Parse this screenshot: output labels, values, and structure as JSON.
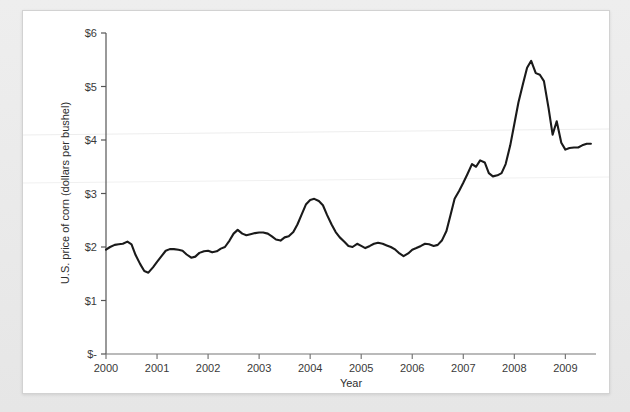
{
  "chart_data": {
    "type": "line",
    "title": "",
    "xlabel": "Year",
    "ylabel": "U.S. price of corn (dollars per bushel)",
    "xlim": [
      2000,
      2009.6
    ],
    "ylim": [
      0,
      6
    ],
    "grid": false,
    "legend": null,
    "line_color": "#1a1a1a",
    "x_tick_labels": [
      "2000",
      "2001",
      "2002",
      "2003",
      "2004",
      "2005",
      "2006",
      "2007",
      "2008",
      "2009"
    ],
    "x_ticks": [
      2000,
      2001,
      2002,
      2003,
      2004,
      2005,
      2006,
      2007,
      2008,
      2009
    ],
    "y_tick_labels": [
      "$-",
      "$1",
      "$2",
      "$3",
      "$4",
      "$5",
      "$6"
    ],
    "y_ticks": [
      0,
      1,
      2,
      3,
      4,
      5,
      6
    ],
    "series": [
      {
        "name": "U.S. price of corn",
        "x": [
          2000.0,
          2000.08,
          2000.17,
          2000.25,
          2000.33,
          2000.42,
          2000.5,
          2000.58,
          2000.67,
          2000.75,
          2000.83,
          2000.92,
          2001.0,
          2001.08,
          2001.17,
          2001.25,
          2001.33,
          2001.42,
          2001.5,
          2001.58,
          2001.67,
          2001.75,
          2001.83,
          2001.92,
          2002.0,
          2002.08,
          2002.17,
          2002.25,
          2002.33,
          2002.42,
          2002.5,
          2002.58,
          2002.67,
          2002.75,
          2002.83,
          2002.92,
          2003.0,
          2003.08,
          2003.17,
          2003.25,
          2003.33,
          2003.42,
          2003.5,
          2003.58,
          2003.67,
          2003.75,
          2003.83,
          2003.92,
          2004.0,
          2004.08,
          2004.17,
          2004.25,
          2004.33,
          2004.42,
          2004.5,
          2004.58,
          2004.67,
          2004.75,
          2004.83,
          2004.92,
          2005.0,
          2005.08,
          2005.17,
          2005.25,
          2005.33,
          2005.42,
          2005.5,
          2005.58,
          2005.67,
          2005.75,
          2005.83,
          2005.92,
          2006.0,
          2006.08,
          2006.17,
          2006.25,
          2006.33,
          2006.42,
          2006.5,
          2006.58,
          2006.67,
          2006.75,
          2006.83,
          2006.92,
          2007.0,
          2007.08,
          2007.17,
          2007.25,
          2007.33,
          2007.42,
          2007.5,
          2007.58,
          2007.67,
          2007.75,
          2007.83,
          2007.92,
          2008.0,
          2008.08,
          2008.17,
          2008.25,
          2008.33,
          2008.42,
          2008.5,
          2008.58,
          2008.67,
          2008.75,
          2008.83,
          2008.92,
          2009.0,
          2009.08,
          2009.17,
          2009.25,
          2009.33,
          2009.42,
          2009.5
        ],
        "values": [
          1.95,
          2.0,
          2.04,
          2.05,
          2.06,
          2.1,
          2.05,
          1.85,
          1.68,
          1.55,
          1.52,
          1.62,
          1.72,
          1.82,
          1.93,
          1.96,
          1.96,
          1.95,
          1.93,
          1.86,
          1.8,
          1.82,
          1.89,
          1.92,
          1.93,
          1.9,
          1.92,
          1.97,
          2.0,
          2.12,
          2.25,
          2.32,
          2.25,
          2.22,
          2.24,
          2.26,
          2.27,
          2.27,
          2.25,
          2.2,
          2.14,
          2.12,
          2.18,
          2.2,
          2.28,
          2.42,
          2.6,
          2.8,
          2.88,
          2.9,
          2.86,
          2.78,
          2.6,
          2.42,
          2.28,
          2.18,
          2.1,
          2.02,
          2.0,
          2.06,
          2.02,
          1.98,
          2.02,
          2.06,
          2.08,
          2.06,
          2.03,
          2.0,
          1.95,
          1.88,
          1.83,
          1.88,
          1.95,
          1.98,
          2.02,
          2.06,
          2.05,
          2.02,
          2.04,
          2.12,
          2.3,
          2.6,
          2.9,
          3.05,
          3.2,
          3.36,
          3.55,
          3.5,
          3.62,
          3.58,
          3.38,
          3.32,
          3.34,
          3.38,
          3.55,
          3.9,
          4.3,
          4.7,
          5.05,
          5.35,
          5.48,
          5.25,
          5.22,
          5.1,
          4.6,
          4.1,
          4.35,
          3.95,
          3.82,
          3.85,
          3.86,
          3.86,
          3.9,
          3.93,
          3.93
        ]
      }
    ]
  }
}
